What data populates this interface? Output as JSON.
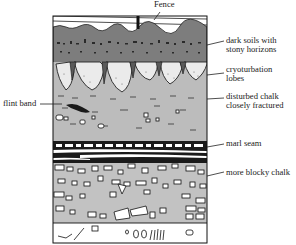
{
  "diagram": {
    "type": "geological-cross-section",
    "labels": {
      "fence": "Fence",
      "dark_soils_line1": "dark soils with",
      "dark_soils_line2": "stony horizons",
      "cryoturbation_line1": "cryoturbation",
      "cryoturbation_line2": "lobes",
      "disturbed_line1": "disturbed chalk",
      "disturbed_line2": "closely fractured",
      "flint_band": "flint band",
      "marl_seam": "marl seam",
      "blocky_chalk": "more blocky chalk"
    },
    "layers": [
      {
        "name": "surface",
        "color": "#ffffff"
      },
      {
        "name": "dark soils with stony horizons",
        "color": "#7d7d7d"
      },
      {
        "name": "cryoturbation lobes",
        "color": "#ebebeb"
      },
      {
        "name": "disturbed chalk closely fractured",
        "color": "#bcbcbc"
      },
      {
        "name": "marl seam",
        "color": "#1a1a1a"
      },
      {
        "name": "more blocky chalk",
        "color": "#c2c2c2"
      },
      {
        "name": "base",
        "color": "#ffffff"
      }
    ]
  }
}
